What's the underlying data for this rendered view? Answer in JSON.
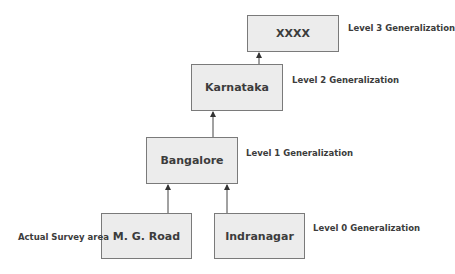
{
  "diagram": {
    "nodes": [
      {
        "id": "xxxx",
        "label": "XXXX"
      },
      {
        "id": "karnataka",
        "label": "Karnataka"
      },
      {
        "id": "bangalore",
        "label": "Bangalore"
      },
      {
        "id": "mgroad",
        "label": "M. G. Road"
      },
      {
        "id": "indranagar",
        "label": "Indranagar"
      }
    ],
    "levels": [
      "Level 3 Generalization",
      "Level 2 Generalization",
      "Level 1 Generalization",
      "Level 0 Generalization"
    ],
    "side_label": "Actual Survey area",
    "edges": [
      {
        "from": "mgroad",
        "to": "bangalore"
      },
      {
        "from": "indranagar",
        "to": "bangalore"
      },
      {
        "from": "bangalore",
        "to": "karnataka"
      },
      {
        "from": "karnataka",
        "to": "xxxx"
      }
    ],
    "colors": {
      "box_fill": "#ececec",
      "box_border": "#7a7a7a",
      "text": "#3c3c3c"
    }
  }
}
